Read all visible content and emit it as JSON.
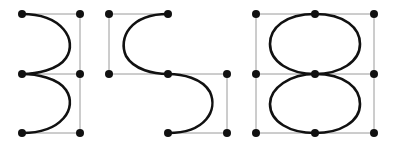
{
  "diagram": {
    "title": "",
    "colors": {
      "curve": "#111111",
      "grid": "#9a9a9a",
      "point": "#111111",
      "background": "#ffffff"
    },
    "rows_y": [
      14,
      74,
      133
    ],
    "glyphs": [
      {
        "name": "three",
        "columns_x": [
          22,
          80
        ],
        "points": [
          [
            22,
            14
          ],
          [
            80,
            14
          ],
          [
            22,
            74
          ],
          [
            80,
            74
          ],
          [
            22,
            133
          ],
          [
            80,
            133
          ]
        ],
        "grid_lines": [
          [
            22,
            14,
            80,
            14
          ],
          [
            80,
            14,
            80,
            133
          ],
          [
            22,
            74,
            80,
            74
          ],
          [
            22,
            133,
            80,
            133
          ]
        ],
        "path": "M22,14 C62,14 78,40 66,58 C58,70 36,74 22,74 C36,74 58,78 66,90 C78,108 62,133 22,133"
      },
      {
        "name": "s",
        "columns_x": [
          109,
          168,
          227
        ],
        "points": [
          [
            109,
            14
          ],
          [
            168,
            14
          ],
          [
            109,
            74
          ],
          [
            168,
            74
          ],
          [
            227,
            74
          ],
          [
            168,
            133
          ],
          [
            227,
            133
          ]
        ],
        "grid_lines": [
          [
            109,
            14,
            168,
            14
          ],
          [
            109,
            14,
            109,
            74
          ],
          [
            109,
            74,
            227,
            74
          ],
          [
            227,
            74,
            227,
            133
          ],
          [
            168,
            133,
            227,
            133
          ]
        ],
        "path": "M168,14 C130,14 118,38 126,56 C134,70 154,74 168,74 C182,74 202,78 210,92 C218,110 206,133 168,133"
      },
      {
        "name": "eight",
        "columns_x": [
          256,
          315,
          374
        ],
        "points": [
          [
            256,
            14
          ],
          [
            315,
            14
          ],
          [
            374,
            14
          ],
          [
            256,
            74
          ],
          [
            315,
            74
          ],
          [
            374,
            74
          ],
          [
            256,
            133
          ],
          [
            315,
            133
          ],
          [
            374,
            133
          ]
        ],
        "grid_lines": [
          [
            256,
            14,
            374,
            14
          ],
          [
            256,
            74,
            374,
            74
          ],
          [
            256,
            133,
            374,
            133
          ],
          [
            256,
            14,
            256,
            133
          ],
          [
            374,
            14,
            374,
            133
          ]
        ],
        "path": "M315,14 C345,14 360,28 360,44 C360,62 340,74 315,74 C290,74 270,62 270,44 C270,28 285,14 315,14 Z M315,74 C345,74 360,88 360,104 C360,122 340,133 315,133 C290,133 270,122 270,104 C270,88 290,74 315,74 Z"
      }
    ]
  }
}
